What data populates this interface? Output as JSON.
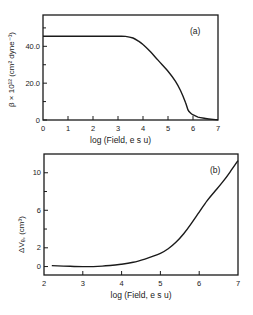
{
  "chart_data": [
    {
      "type": "line",
      "panel_label": "(a)",
      "title": "",
      "xlabel": "log (Field, e s u)",
      "ylabel": "β × 10¹² (cm² dyne⁻¹)",
      "xlim": [
        0,
        7
      ],
      "ylim": [
        0,
        57
      ],
      "xticks": [
        0,
        1,
        2,
        3,
        4,
        5,
        6,
        7
      ],
      "xtick_labels": [
        "0",
        "1",
        "2",
        "3",
        "4",
        "5",
        "6",
        "7"
      ],
      "yticks": [
        0,
        20,
        40
      ],
      "ytick_labels": [
        "0",
        "20.0",
        "40.0"
      ],
      "yminor_ticks": [
        10,
        30,
        50
      ],
      "grid": false,
      "series": [
        {
          "name": "beta",
          "x": [
            0,
            1,
            2,
            3,
            3.3,
            3.6,
            3.8,
            4.0,
            4.3,
            4.6,
            5.0,
            5.3,
            5.5,
            5.7,
            5.8,
            5.9,
            6.0,
            6.2,
            6.5,
            6.8,
            7.0
          ],
          "y": [
            45.5,
            45.5,
            45.5,
            45.5,
            45.4,
            44.5,
            43.0,
            41.0,
            37.0,
            32.5,
            26.5,
            21.0,
            16.0,
            9.5,
            5.5,
            3.8,
            2.8,
            1.6,
            0.8,
            0.3,
            0.1
          ]
        }
      ]
    },
    {
      "type": "line",
      "panel_label": "(b)",
      "title": "",
      "xlabel": "log (Field, e s u)",
      "ylabel": "ΔVₑ, (cm³)",
      "xlim": [
        2,
        7
      ],
      "ylim": [
        -0.9,
        12
      ],
      "xticks": [
        2,
        3,
        4,
        5,
        6,
        7
      ],
      "xtick_labels": [
        "2",
        "3",
        "4",
        "5",
        "6",
        "7"
      ],
      "yticks": [
        0,
        2,
        6,
        10
      ],
      "ytick_labels": [
        "0",
        "2",
        "6",
        "10"
      ],
      "yminor_ticks": [
        4,
        8
      ],
      "grid": false,
      "series": [
        {
          "name": "delta_Ve",
          "x": [
            2.2,
            2.5,
            3.0,
            3.5,
            4.0,
            4.3,
            4.6,
            5.0,
            5.2,
            5.4,
            5.6,
            5.8,
            6.0,
            6.2,
            6.4,
            6.6,
            6.8,
            7.0
          ],
          "y": [
            0.1,
            0.05,
            0.0,
            0.05,
            0.25,
            0.45,
            0.8,
            1.4,
            1.9,
            2.6,
            3.5,
            4.6,
            5.8,
            7.0,
            8.0,
            9.0,
            10.1,
            11.3
          ]
        }
      ]
    }
  ]
}
